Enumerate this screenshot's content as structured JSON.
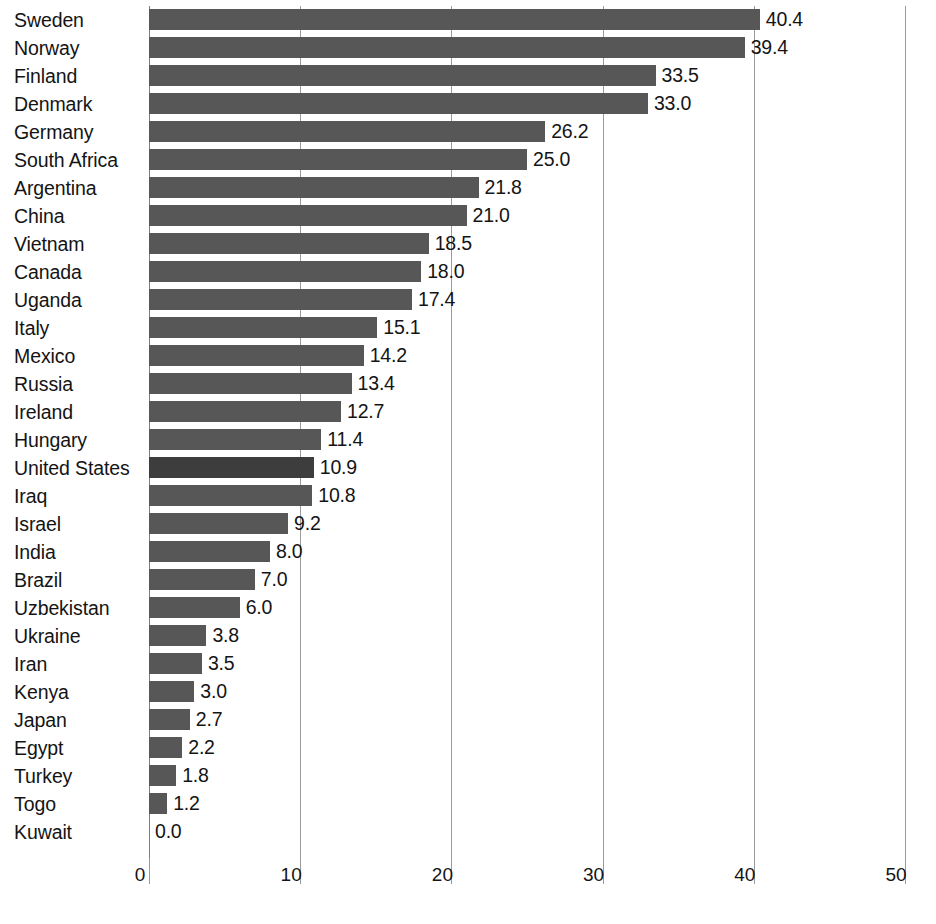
{
  "chart_data": {
    "type": "bar",
    "orientation": "horizontal",
    "title": "",
    "subtitle": "",
    "xlabel": "",
    "ylabel": "",
    "xlim": [
      0,
      50
    ],
    "xticks": [
      "0",
      "10",
      "20",
      "30",
      "40",
      "50"
    ],
    "xtick_values": [
      0,
      10,
      20,
      30,
      40,
      50
    ],
    "grid": "vertical",
    "legend": "none",
    "categories": [
      "Sweden",
      "Norway",
      "Finland",
      "Denmark",
      "Germany",
      "South Africa",
      "Argentina",
      "China",
      "Vietnam",
      "Canada",
      "Uganda",
      "Italy",
      "Mexico",
      "Russia",
      "Ireland",
      "Hungary",
      "United States",
      "Iraq",
      "Israel",
      "India",
      "Brazil",
      "Uzbekistan",
      "Ukraine",
      "Iran",
      "Kenya",
      "Japan",
      "Egypt",
      "Turkey",
      "Togo",
      "Kuwait"
    ],
    "values": [
      40.4,
      39.4,
      33.5,
      33.0,
      26.2,
      25.0,
      21.8,
      21.0,
      18.5,
      18.0,
      17.4,
      15.1,
      14.2,
      13.4,
      12.7,
      11.4,
      10.9,
      10.8,
      9.2,
      8.0,
      7.0,
      6.0,
      3.8,
      3.5,
      3.0,
      2.7,
      2.2,
      1.8,
      1.2,
      0.0
    ],
    "value_labels": [
      "40.4",
      "39.4",
      "33.5",
      "33.0",
      "26.2",
      "25.0",
      "21.8",
      "21.0",
      "18.5",
      "18.0",
      "17.4",
      "15.1",
      "14.2",
      "13.4",
      "12.7",
      "11.4",
      "10.9",
      "10.8",
      "9.2",
      "8.0",
      "7.0",
      "6.0",
      "3.8",
      "3.5",
      "3.0",
      "2.7",
      "2.2",
      "1.8",
      "1.2",
      "0.0"
    ],
    "highlighted_category": "United States",
    "colors": {
      "bar": "#575757",
      "bar_highlight": "#3d3d3d",
      "gridline": "#9a9a9a",
      "text": "#141414",
      "background": "#ffffff"
    }
  },
  "caption_fragment": ""
}
